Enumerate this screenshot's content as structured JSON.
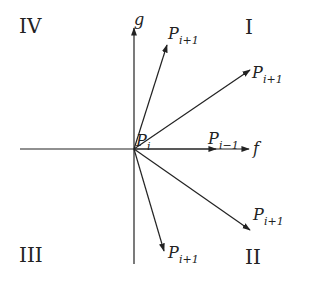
{
  "diagram": {
    "quadrants": {
      "q1": "I",
      "q2": "II",
      "q3": "III",
      "q4": "IV"
    },
    "axes": {
      "horizontal_label": "f",
      "vertical_label": "g"
    },
    "origin_label": {
      "base": "P",
      "sub": "i"
    },
    "prev_point_label": {
      "base": "P",
      "sub": "i−1"
    },
    "next_point_labels": [
      {
        "base": "P",
        "sub": "i+1",
        "quadrant": "I",
        "position": "steep"
      },
      {
        "base": "P",
        "sub": "i+1",
        "quadrant": "I",
        "position": "shallow"
      },
      {
        "base": "P",
        "sub": "i+1",
        "quadrant": "II",
        "position": "shallow"
      },
      {
        "base": "P",
        "sub": "i+1",
        "quadrant": "II",
        "position": "steep"
      }
    ],
    "colors": {
      "line": "#222222",
      "background": "#ffffff"
    }
  }
}
